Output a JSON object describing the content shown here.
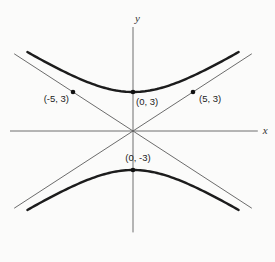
{
  "figure": {
    "background": "#fbfbfa",
    "curve_color": "#1c1c1c",
    "asymptote_color": "#5b5b5b",
    "axis_color": "#6e6e6e",
    "point_color": "#111111",
    "label_color": "#222222"
  },
  "plot": {
    "origin_px": [
      133,
      131
    ],
    "px_per_unit_x": 12,
    "px_per_unit_y": 13
  },
  "chart_data": {
    "type": "line",
    "title": "",
    "xlabel": "x",
    "ylabel": "y",
    "grid": false,
    "x_axis": {
      "min": -10.25,
      "max": 10.4,
      "label": "x"
    },
    "y_axis": {
      "min": -7.8,
      "max": 8.0,
      "label": "y"
    },
    "hyperbola": {
      "a": 3,
      "b": 5,
      "orientation": "vertical",
      "x_extent": 8.8,
      "branches": [
        "upper",
        "lower"
      ],
      "vertices": [
        [
          0,
          3
        ],
        [
          0,
          -3
        ]
      ]
    },
    "asymptotes": [
      {
        "slope": 0.6,
        "intercept": 0,
        "x_min": -9.9,
        "x_max": 9.9
      },
      {
        "slope": -0.6,
        "intercept": 0,
        "x_min": -9.9,
        "x_max": 9.9
      }
    ],
    "points": [
      {
        "x": -5,
        "y": 3,
        "label": "(-5, 3)",
        "anchor": "end",
        "dx": -4,
        "dy": 10
      },
      {
        "x": 0,
        "y": 3,
        "label": "(0, 3)",
        "anchor": "start",
        "dx": 3,
        "dy": 13
      },
      {
        "x": 5,
        "y": 3,
        "label": "(5, 3)",
        "anchor": "start",
        "dx": 6,
        "dy": 10
      },
      {
        "x": 0,
        "y": -3,
        "label": "(0, -3)",
        "anchor": "middle",
        "dx": 5,
        "dy": -9
      }
    ]
  }
}
